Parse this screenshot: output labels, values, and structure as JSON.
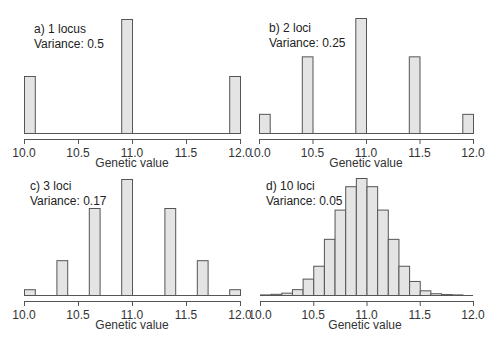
{
  "chart_data": [
    {
      "type": "bar",
      "panel": "a",
      "title": "a) 1 locus",
      "subtitle": "Variance: 0.5",
      "xlabel": "Genetic value",
      "ylabel": "",
      "xlim": [
        10.0,
        12.0
      ],
      "xticks": [
        "10.0",
        "10.5",
        "11.0",
        "11.5",
        "12.0"
      ],
      "bin_width": 0.1,
      "bins": [
        {
          "x0": 10.0,
          "x1": 10.1,
          "value": 0.25
        },
        {
          "x0": 10.9,
          "x1": 11.0,
          "value": 0.5
        },
        {
          "x0": 11.9,
          "x1": 12.0,
          "value": 0.25
        }
      ]
    },
    {
      "type": "bar",
      "panel": "b",
      "title": "b) 2 loci",
      "subtitle": "Variance: 0.25",
      "xlabel": "Genetic value",
      "ylabel": "",
      "xlim": [
        10.0,
        12.0
      ],
      "xticks": [
        "10.0",
        "10.5",
        "11.0",
        "11.5",
        "12.0"
      ],
      "bin_width": 0.1,
      "bins": [
        {
          "x0": 10.0,
          "x1": 10.1,
          "value": 0.0625
        },
        {
          "x0": 10.4,
          "x1": 10.5,
          "value": 0.25
        },
        {
          "x0": 10.9,
          "x1": 11.0,
          "value": 0.375
        },
        {
          "x0": 11.4,
          "x1": 11.5,
          "value": 0.25
        },
        {
          "x0": 11.9,
          "x1": 12.0,
          "value": 0.0625
        }
      ]
    },
    {
      "type": "bar",
      "panel": "c",
      "title": "c) 3 loci",
      "subtitle": "Variance: 0.17",
      "xlabel": "Genetic value",
      "ylabel": "",
      "xlim": [
        10.0,
        12.0
      ],
      "xticks": [
        "10.0",
        "10.5",
        "11.0",
        "11.5",
        "12.0"
      ],
      "bin_width": 0.1,
      "bins": [
        {
          "x0": 10.0,
          "x1": 10.1,
          "value": 0.0156
        },
        {
          "x0": 10.3,
          "x1": 10.4,
          "value": 0.0938
        },
        {
          "x0": 10.6,
          "x1": 10.7,
          "value": 0.2344
        },
        {
          "x0": 10.9,
          "x1": 11.0,
          "value": 0.3125
        },
        {
          "x0": 11.3,
          "x1": 11.4,
          "value": 0.2344
        },
        {
          "x0": 11.6,
          "x1": 11.7,
          "value": 0.0938
        },
        {
          "x0": 11.9,
          "x1": 12.0,
          "value": 0.0156
        }
      ]
    },
    {
      "type": "bar",
      "panel": "d",
      "title": "d) 10 loci",
      "subtitle": "Variance: 0.05",
      "xlabel": "Genetic value",
      "ylabel": "",
      "xlim": [
        10.0,
        12.0
      ],
      "xticks": [
        "10.0",
        "10.5",
        "11.0",
        "11.5",
        "12.0"
      ],
      "bin_width": 0.1,
      "bins": [
        {
          "x0": 10.0,
          "x1": 10.1,
          "value": 0.005
        },
        {
          "x0": 10.1,
          "x1": 10.2,
          "value": 0.01
        },
        {
          "x0": 10.2,
          "x1": 10.3,
          "value": 0.02
        },
        {
          "x0": 10.3,
          "x1": 10.4,
          "value": 0.05
        },
        {
          "x0": 10.4,
          "x1": 10.5,
          "value": 0.14
        },
        {
          "x0": 10.5,
          "x1": 10.6,
          "value": 0.25
        },
        {
          "x0": 10.6,
          "x1": 10.7,
          "value": 0.48
        },
        {
          "x0": 10.7,
          "x1": 10.8,
          "value": 0.73
        },
        {
          "x0": 10.8,
          "x1": 10.9,
          "value": 0.93
        },
        {
          "x0": 10.9,
          "x1": 11.0,
          "value": 1.0
        },
        {
          "x0": 11.0,
          "x1": 11.1,
          "value": 0.93
        },
        {
          "x0": 11.1,
          "x1": 11.2,
          "value": 0.73
        },
        {
          "x0": 11.2,
          "x1": 11.3,
          "value": 0.48
        },
        {
          "x0": 11.3,
          "x1": 11.4,
          "value": 0.25
        },
        {
          "x0": 11.4,
          "x1": 11.5,
          "value": 0.12
        },
        {
          "x0": 11.5,
          "x1": 11.6,
          "value": 0.04
        },
        {
          "x0": 11.6,
          "x1": 11.7,
          "value": 0.015
        },
        {
          "x0": 11.7,
          "x1": 11.8,
          "value": 0.008
        },
        {
          "x0": 11.8,
          "x1": 11.9,
          "value": 0.005
        },
        {
          "x0": 11.9,
          "x1": 12.0,
          "value": 0.0
        }
      ]
    }
  ],
  "colors": {
    "bar_fill": "#e4e4e4",
    "bar_stroke": "#555555",
    "axis": "#555555"
  },
  "panels": [
    {
      "title": "a) 1 locus",
      "subtitle": "Variance: 0.5",
      "xlabel": "Genetic value"
    },
    {
      "title": "b) 2 loci",
      "subtitle": "Variance: 0.25",
      "xlabel": "Genetic value"
    },
    {
      "title": "c) 3 loci",
      "subtitle": "Variance: 0.17",
      "xlabel": "Genetic value"
    },
    {
      "title": "d) 10 loci",
      "subtitle": "Variance: 0.05",
      "xlabel": "Genetic value"
    }
  ]
}
